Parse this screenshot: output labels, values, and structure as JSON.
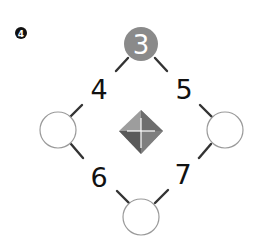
{
  "problem": {
    "badge_number": "4",
    "top_circle_value": "3",
    "edge_numbers": {
      "top_left": "4",
      "top_right": "5",
      "bottom_left": "6",
      "bottom_right": "7"
    },
    "empty_circles": [
      "left",
      "right",
      "bottom"
    ],
    "center_icon": "diamond-gem-icon"
  },
  "colors": {
    "filled_circle": "#8a8a8a",
    "circle_stroke": "#9a9a9a",
    "connector": "#333333",
    "text": "#111111",
    "gem_light": "#9d9d9d",
    "gem_dark": "#5a5a5a"
  }
}
